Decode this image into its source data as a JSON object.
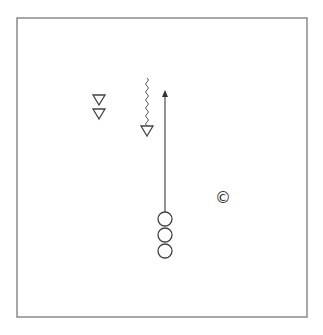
{
  "diagram": {
    "type": "sports-drill",
    "frame": {
      "x": 17,
      "y": 18,
      "width": 290,
      "height": 299,
      "stroke": "#8a8a8a"
    },
    "colors": {
      "stroke": "#555555",
      "arrow": "#777777",
      "background": "#ffffff"
    },
    "players_triangle": [
      {
        "id": "defender-1",
        "cx": 99,
        "cy": 100
      },
      {
        "id": "defender-2",
        "cx": 99,
        "cy": 114
      },
      {
        "id": "defender-3",
        "cx": 147,
        "cy": 131
      }
    ],
    "players_circle": [
      {
        "id": "attacker-1",
        "cx": 165,
        "cy": 219,
        "r": 7
      },
      {
        "id": "attacker-2",
        "cx": 165,
        "cy": 235,
        "r": 7
      },
      {
        "id": "attacker-3",
        "cx": 165,
        "cy": 251,
        "r": 7
      }
    ],
    "coach": {
      "symbol": "©",
      "cx": 223,
      "cy": 197
    },
    "run_arrow": {
      "x": 165,
      "y_start": 212,
      "y_end": 90
    },
    "dribble_path": {
      "x": 147,
      "y_start": 78,
      "y_end": 127
    }
  }
}
